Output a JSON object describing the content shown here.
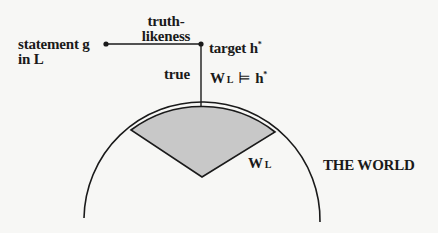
{
  "diagram": {
    "labels": {
      "truthlikeness_line1": "truth-",
      "truthlikeness_line2": "likeness",
      "statement_line1": "statement g",
      "statement_line2": "in L",
      "target": "target h",
      "target_sup": "*",
      "true": "true",
      "entail_W": "W",
      "entail_sub": "L",
      "entail_symbol": "⊨",
      "entail_h": "h",
      "entail_sup": "*",
      "sector_W": "W",
      "sector_sub": "L",
      "world": "THE WORLD"
    },
    "colors": {
      "line": "#1a1a1a",
      "sector_fill": "#c8c8c8",
      "background": "#f7f7f5"
    }
  }
}
